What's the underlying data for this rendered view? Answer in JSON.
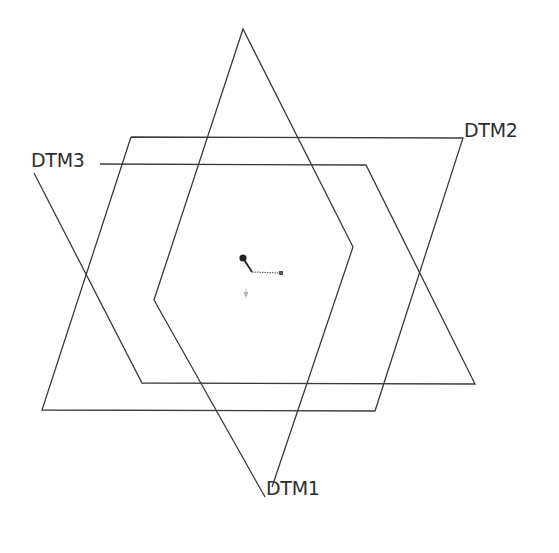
{
  "datums": [
    {
      "id": "DTM1",
      "label": "DTM1"
    },
    {
      "id": "DTM2",
      "label": "DTM2"
    },
    {
      "id": "DTM3",
      "label": "DTM3"
    }
  ],
  "colors": {
    "background": "#ffffff",
    "plane_stroke": "#3a3a3a",
    "label_text": "#2e2e2e",
    "csys_primary": "#222222",
    "csys_secondary": "#666666",
    "csys_faint": "#b0b0b0"
  }
}
